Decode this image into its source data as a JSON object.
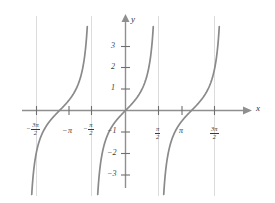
{
  "chart_data": {
    "type": "line",
    "title": "",
    "xlabel": "x",
    "ylabel": "y",
    "function": "y = tan(x)",
    "xlim": [
      -5.1,
      5.4
    ],
    "ylim": [
      -3.8,
      3.8
    ],
    "grid": false,
    "legend": null,
    "x_ticks": [
      {
        "value": -4.71238898,
        "label": "-3π/2",
        "sign": "−",
        "num": "3π",
        "den": "2",
        "kind": "fraction"
      },
      {
        "value": -3.141592653,
        "label": "-π",
        "sign": "−",
        "num": "π",
        "den": "",
        "kind": "plain"
      },
      {
        "value": -1.570796326,
        "label": "-π/2",
        "sign": "−",
        "num": "π",
        "den": "2",
        "kind": "fraction"
      },
      {
        "value": 1.570796326,
        "label": "π/2",
        "sign": "",
        "num": "π",
        "den": "2",
        "kind": "fraction"
      },
      {
        "value": 3.141592653,
        "label": "π",
        "sign": "",
        "num": "π",
        "den": "",
        "kind": "plain"
      },
      {
        "value": 4.71238898,
        "label": "3π/2",
        "sign": "",
        "num": "3π",
        "den": "2",
        "kind": "fraction"
      }
    ],
    "y_ticks": [
      {
        "value": 3,
        "label": "3"
      },
      {
        "value": 2,
        "label": "2"
      },
      {
        "value": 1,
        "label": "1"
      },
      {
        "value": -1,
        "label": "−1"
      },
      {
        "value": -2,
        "label": "−2"
      },
      {
        "value": -3,
        "label": "−3"
      }
    ],
    "asymptotes": [
      -4.71238898,
      -1.570796326,
      1.570796326,
      4.71238898
    ],
    "branches": [
      {
        "center": -3.141592653,
        "from": -4.71238898,
        "to": -1.570796326
      },
      {
        "center": 0,
        "from": -1.570796326,
        "to": 1.570796326
      },
      {
        "center": 3.141592653,
        "from": 1.570796326,
        "to": 4.71238898
      }
    ],
    "zero_crossings": [
      -3.141592653,
      0,
      3.141592653
    ]
  },
  "axes": {
    "x_axis_label": "x",
    "y_axis_label": "y"
  },
  "colors": {
    "curve": "#8a8a8a",
    "axis": "#8f8f8f",
    "asymptote": "#d8d8d8",
    "text": "#3a3a3a",
    "background": "#ffffff"
  }
}
